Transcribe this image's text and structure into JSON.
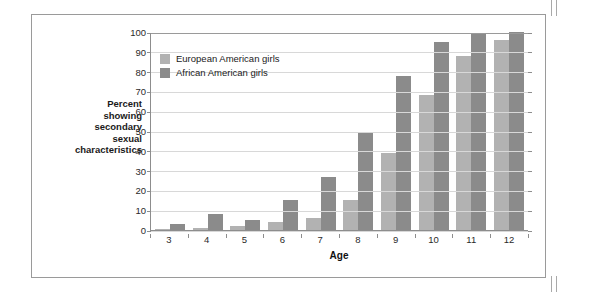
{
  "figure": {
    "y_caption_lines": [
      "Percent",
      "showing",
      "secondary",
      "sexual",
      "characteristics"
    ]
  },
  "colors": {
    "series_european": "#b2b2b2",
    "series_african": "#8b8b8b",
    "gridline": "#d8d8d8",
    "axis": "#8d8d8d",
    "frame": "#9a9a9a"
  },
  "chart_data": {
    "type": "bar",
    "title": "",
    "subtitle": "",
    "xlabel": "Age",
    "ylabel": "Percent showing secondary sexual characteristics",
    "categories": [
      "3",
      "4",
      "5",
      "6",
      "7",
      "8",
      "9",
      "10",
      "11",
      "12"
    ],
    "ylim": [
      0,
      100
    ],
    "yticks": [
      0,
      10,
      20,
      30,
      40,
      50,
      60,
      70,
      80,
      90,
      100
    ],
    "grid": true,
    "legend_position": "top-left inside plot",
    "series": [
      {
        "name": "European American girls",
        "color": "#b2b2b2",
        "values": [
          0.5,
          1,
          2,
          4,
          6,
          15,
          39,
          68,
          88,
          96
        ]
      },
      {
        "name": "African American girls",
        "color": "#8b8b8b",
        "values": [
          3,
          8,
          5,
          15,
          27,
          49,
          78,
          95,
          99,
          100
        ]
      }
    ]
  }
}
